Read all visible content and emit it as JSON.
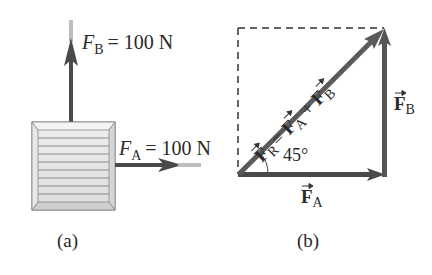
{
  "diagram_a": {
    "caption": "(a)",
    "force_b": {
      "symbol": "F",
      "subscript": "B",
      "equals": "= 100 N"
    },
    "force_a": {
      "symbol": "F",
      "subscript": "A",
      "equals": "= 100 N"
    },
    "object": "crate"
  },
  "diagram_b": {
    "caption": "(b)",
    "resultant": {
      "symbol": "F",
      "subscript": "R",
      "expr_1": "= ",
      "f1": "F",
      "s1": "A",
      "plus": " + ",
      "f2": "F",
      "s2": "B"
    },
    "vector_b": {
      "symbol": "F",
      "subscript": "B"
    },
    "vector_a": {
      "symbol": "F",
      "subscript": "A"
    },
    "angle_label": "45°"
  },
  "colors": {
    "arrow": "#555555",
    "arrow_dark": "#444444",
    "crate_fill": "#e6e6e6",
    "dashed": "#333333"
  }
}
